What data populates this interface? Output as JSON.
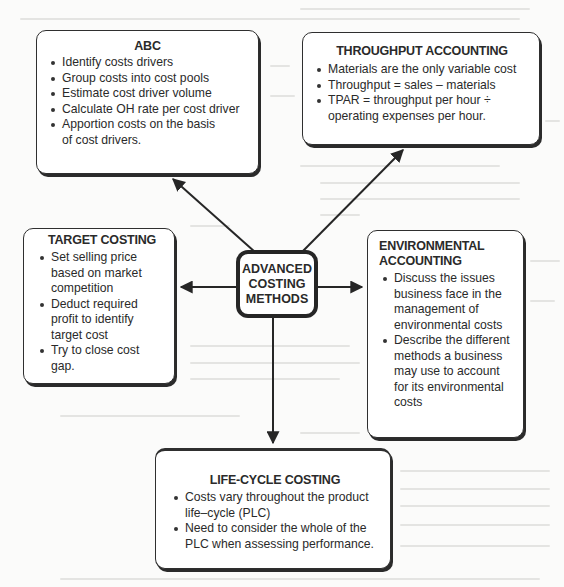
{
  "diagram": {
    "center": {
      "label": "ADVANCED\nCOSTING\nMETHODS"
    },
    "nodes": {
      "abc": {
        "title": "ABC",
        "bullets": [
          "Identify costs drivers",
          "Group costs into cost pools",
          "Estimate cost driver volume",
          "Calculate OH rate per cost driver",
          "Apportion costs on the basis of cost drivers."
        ]
      },
      "throughput": {
        "title": "THROUGHPUT ACCOUNTING",
        "bullets": [
          "Materials are the only variable cost",
          "Throughput = sales – materials",
          "TPAR = throughput per hour ÷ operating expenses per hour."
        ]
      },
      "target": {
        "title": "TARGET COSTING",
        "bullets": [
          "Set selling price based on market competition",
          "Deduct required profit to identify target cost",
          "Try to close cost gap."
        ]
      },
      "environmental": {
        "title": "ENVIRONMENTAL ACCOUNTING",
        "bullets": [
          "Discuss the issues business face in the management of environmental costs",
          "Describe the different methods a business may use to account for its environmental costs"
        ]
      },
      "lifecycle": {
        "title": "LIFE-CYCLE COSTING",
        "bullets": [
          "Costs vary throughout the product life–cycle (PLC)",
          "Need to consider the whole of the PLC when assessing performance."
        ]
      }
    },
    "edges": [
      {
        "from": "center",
        "to": "abc"
      },
      {
        "from": "center",
        "to": "throughput"
      },
      {
        "from": "center",
        "to": "target"
      },
      {
        "from": "center",
        "to": "environmental"
      },
      {
        "from": "center",
        "to": "lifecycle"
      }
    ],
    "colors": {
      "stroke": "#262626",
      "box_fill": "#ffffff",
      "background": "#fbfbfa"
    }
  }
}
